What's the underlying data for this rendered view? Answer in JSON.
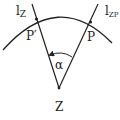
{
  "diagram": {
    "colors": {
      "stroke": "#222222",
      "background": "#ffffff"
    },
    "points": {
      "Z": {
        "label": "Z"
      },
      "P": {
        "label": "P"
      },
      "P_prime": {
        "label": "P′"
      }
    },
    "lines": {
      "l_Z": {
        "label_main": "l",
        "label_sub": "Z"
      },
      "l_ZP": {
        "label_main": "l",
        "label_sub": "ZP"
      }
    },
    "angle": {
      "label": "α"
    }
  }
}
